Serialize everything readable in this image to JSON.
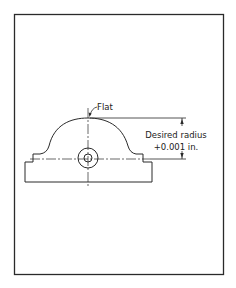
{
  "figure": {
    "type": "technical-drawing",
    "labels": {
      "flat": "Flat",
      "dimension_line1": "Desired radius",
      "dimension_line2": "+0.001 in."
    },
    "colors": {
      "line": "#2a2a2a",
      "background": "#ffffff"
    }
  }
}
